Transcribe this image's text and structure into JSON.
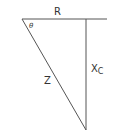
{
  "diagram": {
    "type": "impedance-triangle",
    "labels": {
      "top_side": "R",
      "angle": "θ",
      "hypotenuse": "Z",
      "vertical_side_main": "X",
      "vertical_side_sub": "C"
    },
    "colors": {
      "line": "#555555",
      "text": "#333333",
      "background": "#ffffff"
    }
  }
}
